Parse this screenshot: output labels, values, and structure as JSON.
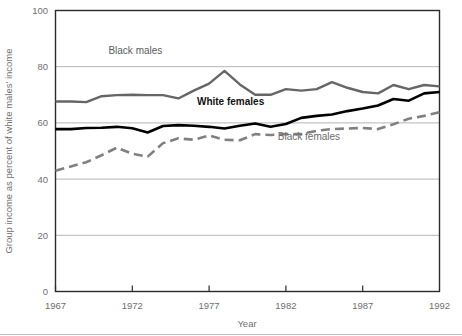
{
  "chart_data": {
    "type": "line",
    "title": "",
    "xlabel": "Year",
    "ylabel": "Group income as percent of white males' income",
    "xlim": [
      1967,
      1992
    ],
    "ylim": [
      0,
      100
    ],
    "grid": "horizontal",
    "legend_position": "inline-annotations",
    "xticks": [
      "1967",
      "1972",
      "1977",
      "1982",
      "1987",
      "1992"
    ],
    "xtick_values": [
      1967,
      1972,
      1977,
      1982,
      1987,
      1992
    ],
    "yticks": [
      "0",
      "20",
      "40",
      "60",
      "80",
      "100"
    ],
    "ytick_values": [
      0,
      20,
      40,
      60,
      80,
      100
    ],
    "x": [
      1967,
      1968,
      1969,
      1970,
      1971,
      1972,
      1973,
      1974,
      1975,
      1976,
      1977,
      1978,
      1979,
      1980,
      1981,
      1982,
      1983,
      1984,
      1985,
      1986,
      1987,
      1988,
      1989,
      1990,
      1991,
      1992
    ],
    "series": [
      {
        "name": "Black males",
        "color": "#666666",
        "style": "solid",
        "width": 2.4,
        "label_x": 1972.2,
        "label_y": 84.5,
        "values": [
          67.6,
          67.6,
          67.4,
          69.5,
          69.9,
          70.0,
          69.9,
          69.9,
          68.7,
          71.5,
          74.0,
          78.5,
          73.7,
          70.0,
          70.0,
          72.0,
          71.5,
          72.0,
          74.5,
          72.5,
          71.0,
          70.5,
          73.5,
          72.0,
          73.5,
          73.0
        ]
      },
      {
        "name": "White females",
        "color": "#000000",
        "style": "solid",
        "width": 2.6,
        "label_x": 1978.4,
        "label_y": 66.5,
        "values": [
          57.8,
          57.8,
          58.2,
          58.3,
          58.6,
          58.1,
          56.6,
          58.9,
          59.2,
          59.0,
          58.6,
          58.0,
          59.0,
          59.8,
          58.6,
          59.6,
          61.8,
          62.5,
          63.0,
          64.2,
          65.1,
          66.2,
          68.5,
          67.9,
          70.5,
          71.0
        ]
      },
      {
        "name": "Black females",
        "color": "#808080",
        "style": "dashed",
        "width": 2.6,
        "label_x": 1983.5,
        "label_y": 54.0,
        "values": [
          43.0,
          44.5,
          46.0,
          48.5,
          51.2,
          49.0,
          48.0,
          52.8,
          54.5,
          54.0,
          55.5,
          54.0,
          53.8,
          56.0,
          55.7,
          56.0,
          56.0,
          57.2,
          57.8,
          58.0,
          58.2,
          57.8,
          59.5,
          61.5,
          62.5,
          63.8
        ]
      }
    ]
  },
  "figure": {
    "bottom_rule": true
  }
}
